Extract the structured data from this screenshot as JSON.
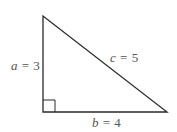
{
  "diagram": {
    "type": "right-triangle",
    "colors": {
      "stroke": "#2a2a2a",
      "label": "#555555",
      "background": "#ffffff"
    },
    "vertices": {
      "top": [
        43,
        16
      ],
      "right_angle": [
        43,
        112
      ],
      "right": [
        167,
        112
      ]
    },
    "right_angle_marker_size": 12,
    "sides": {
      "a": {
        "variable": "a",
        "equals": "=",
        "value": "3",
        "position": "left"
      },
      "b": {
        "variable": "b",
        "equals": "=",
        "value": "4",
        "position": "bottom"
      },
      "c": {
        "variable": "c",
        "equals": "=",
        "value": "5",
        "position": "hypotenuse"
      }
    }
  }
}
